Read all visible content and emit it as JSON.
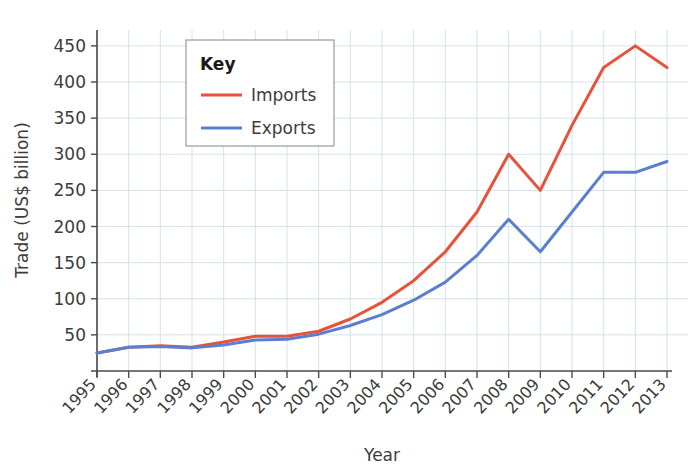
{
  "chart_data": {
    "type": "line",
    "title": "",
    "xlabel": "Year",
    "ylabel": "Trade (US$ billion)",
    "categories": [
      "1995",
      "1996",
      "1997",
      "1998",
      "1999",
      "2000",
      "2001",
      "2002",
      "2003",
      "2004",
      "2005",
      "2006",
      "2007",
      "2008",
      "2009",
      "2010",
      "2011",
      "2012",
      "2013"
    ],
    "x": [
      1995,
      1996,
      1997,
      1998,
      1999,
      2000,
      2001,
      2002,
      2003,
      2004,
      2005,
      2006,
      2007,
      2008,
      2009,
      2010,
      2011,
      2012,
      2013
    ],
    "series": [
      {
        "name": "Imports",
        "color": "#e8513a",
        "values": [
          25,
          33,
          35,
          33,
          40,
          48,
          48,
          55,
          72,
          95,
          125,
          165,
          220,
          300,
          250,
          340,
          420,
          450,
          420
        ]
      },
      {
        "name": "Exports",
        "color": "#5b7fd0",
        "values": [
          25,
          33,
          34,
          32,
          36,
          43,
          44,
          51,
          63,
          78,
          98,
          123,
          160,
          210,
          165,
          220,
          275,
          275,
          290
        ]
      }
    ],
    "ylim": [
      0,
      470
    ],
    "yticks": [
      50,
      100,
      150,
      200,
      250,
      300,
      350,
      400,
      450
    ],
    "ytick_labels": [
      "50",
      "100",
      "150",
      "200",
      "250",
      "300",
      "350",
      "400",
      "450"
    ],
    "xlim": [
      1995,
      2013
    ],
    "grid": true,
    "grid_color": "#cfe0ea",
    "axis_color": "#4a4a4a",
    "legend": {
      "position": "top-left-inside",
      "title": "Key",
      "entries": [
        {
          "label": "Imports",
          "color": "#e8513a"
        },
        {
          "label": "Exports",
          "color": "#5b7fd0"
        }
      ]
    }
  }
}
